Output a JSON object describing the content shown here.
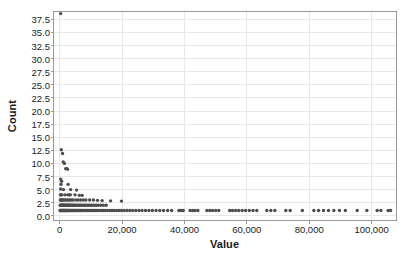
{
  "chart_data": {
    "type": "scatter",
    "title": "",
    "xlabel": "Value",
    "ylabel": "Count",
    "xlim": [
      -2000,
      108000
    ],
    "ylim": [
      -0.9,
      39.0
    ],
    "grid": true,
    "legend": false,
    "xticks": [
      0,
      20000,
      40000,
      60000,
      80000,
      100000
    ],
    "xticklabels": [
      "0",
      "20,000",
      "40,000",
      "60,000",
      "80,000",
      "100,000"
    ],
    "yticks": [
      0.0,
      2.5,
      5.0,
      7.5,
      10.0,
      12.5,
      15.0,
      17.5,
      20.0,
      22.5,
      25.0,
      27.5,
      30.0,
      32.5,
      35.0,
      37.5
    ],
    "yticklabels": [
      "0.0",
      "2.5",
      "5.0",
      "7.5",
      "10.0",
      "12.5",
      "15.0",
      "17.5",
      "20.0",
      "22.5",
      "25.0",
      "27.5",
      "30.0",
      "32.5",
      "35.0",
      "37.5"
    ],
    "marker_color": "#4d4d4d",
    "marker_size": 1.7,
    "grid_color": "#e8e8e8",
    "axis_color": "#9a9a9a",
    "points": [
      [
        300,
        38.6
      ],
      [
        500,
        12.6
      ],
      [
        900,
        11.9
      ],
      [
        1100,
        10.3
      ],
      [
        1500,
        10.0
      ],
      [
        1900,
        9.0
      ],
      [
        2300,
        9.0
      ],
      [
        2500,
        8.9
      ],
      [
        300,
        7.0
      ],
      [
        600,
        6.6
      ],
      [
        400,
        6.0
      ],
      [
        2700,
        6.0
      ],
      [
        300,
        5.1
      ],
      [
        1200,
        5.0
      ],
      [
        3500,
        5.0
      ],
      [
        5400,
        4.9
      ],
      [
        200,
        4.0
      ],
      [
        400,
        4.0
      ],
      [
        700,
        4.0
      ],
      [
        1700,
        4.0
      ],
      [
        2600,
        4.0
      ],
      [
        3100,
        4.0
      ],
      [
        3400,
        4.0
      ],
      [
        4900,
        4.0
      ],
      [
        6300,
        3.9
      ],
      [
        7200,
        3.9
      ],
      [
        200,
        3.0
      ],
      [
        350,
        3.0
      ],
      [
        500,
        3.0
      ],
      [
        800,
        3.0
      ],
      [
        1100,
        3.0
      ],
      [
        1400,
        3.0
      ],
      [
        1900,
        3.0
      ],
      [
        2400,
        3.0
      ],
      [
        2900,
        3.0
      ],
      [
        3300,
        3.0
      ],
      [
        3800,
        3.0
      ],
      [
        4300,
        3.0
      ],
      [
        5200,
        3.0
      ],
      [
        5900,
        3.0
      ],
      [
        6700,
        3.0
      ],
      [
        7600,
        3.0
      ],
      [
        8400,
        3.0
      ],
      [
        9600,
        3.0
      ],
      [
        10800,
        3.0
      ],
      [
        12100,
        2.95
      ],
      [
        13600,
        2.9
      ],
      [
        16300,
        2.85
      ],
      [
        19800,
        2.8
      ],
      [
        150,
        2.0
      ],
      [
        300,
        2.0
      ],
      [
        450,
        2.0
      ],
      [
        600,
        2.0
      ],
      [
        750,
        2.0
      ],
      [
        900,
        2.0
      ],
      [
        1050,
        2.0
      ],
      [
        1200,
        2.0
      ],
      [
        1350,
        2.0
      ],
      [
        1500,
        2.0
      ],
      [
        1700,
        2.0
      ],
      [
        1900,
        2.0
      ],
      [
        2100,
        2.0
      ],
      [
        2300,
        2.0
      ],
      [
        2500,
        2.0
      ],
      [
        2700,
        2.0
      ],
      [
        2900,
        2.0
      ],
      [
        3100,
        2.0
      ],
      [
        3300,
        2.0
      ],
      [
        3600,
        2.0
      ],
      [
        3900,
        2.0
      ],
      [
        4200,
        2.0
      ],
      [
        4500,
        2.0
      ],
      [
        4800,
        2.0
      ],
      [
        5100,
        2.0
      ],
      [
        5500,
        2.0
      ],
      [
        5900,
        2.0
      ],
      [
        6300,
        2.0
      ],
      [
        6700,
        2.0
      ],
      [
        7100,
        2.0
      ],
      [
        7600,
        2.0
      ],
      [
        8100,
        2.0
      ],
      [
        8600,
        2.0
      ],
      [
        9100,
        2.0
      ],
      [
        9700,
        2.0
      ],
      [
        10300,
        2.0
      ],
      [
        11000,
        2.0
      ],
      [
        11700,
        2.0
      ],
      [
        12400,
        2.0
      ],
      [
        13200,
        2.0
      ],
      [
        14000,
        2.0
      ],
      [
        14900,
        2.0
      ],
      [
        100,
        1.0
      ],
      [
        250,
        1.0
      ],
      [
        400,
        1.0
      ],
      [
        550,
        1.0
      ],
      [
        700,
        1.0
      ],
      [
        850,
        1.0
      ],
      [
        1000,
        1.0
      ],
      [
        1150,
        1.0
      ],
      [
        1300,
        1.0
      ],
      [
        1450,
        1.0
      ],
      [
        1600,
        1.0
      ],
      [
        1750,
        1.0
      ],
      [
        1900,
        1.0
      ],
      [
        2050,
        1.0
      ],
      [
        2200,
        1.0
      ],
      [
        2400,
        1.0
      ],
      [
        2600,
        1.0
      ],
      [
        2800,
        1.0
      ],
      [
        3000,
        1.0
      ],
      [
        3200,
        1.0
      ],
      [
        3400,
        1.0
      ],
      [
        3600,
        1.0
      ],
      [
        3800,
        1.0
      ],
      [
        4000,
        1.0
      ],
      [
        4250,
        1.0
      ],
      [
        4500,
        1.0
      ],
      [
        4750,
        1.0
      ],
      [
        5000,
        1.0
      ],
      [
        5250,
        1.0
      ],
      [
        5500,
        1.0
      ],
      [
        5800,
        1.0
      ],
      [
        6100,
        1.0
      ],
      [
        6400,
        1.0
      ],
      [
        6700,
        1.0
      ],
      [
        7000,
        1.0
      ],
      [
        7300,
        1.0
      ],
      [
        7700,
        1.0
      ],
      [
        8100,
        1.0
      ],
      [
        8500,
        1.0
      ],
      [
        8900,
        1.0
      ],
      [
        9300,
        1.0
      ],
      [
        9700,
        1.0
      ],
      [
        10200,
        1.0
      ],
      [
        10700,
        1.0
      ],
      [
        11200,
        1.0
      ],
      [
        11700,
        1.0
      ],
      [
        12200,
        1.0
      ],
      [
        12800,
        1.0
      ],
      [
        13400,
        1.0
      ],
      [
        14000,
        1.0
      ],
      [
        14600,
        1.0
      ],
      [
        15300,
        1.0
      ],
      [
        16000,
        1.0
      ],
      [
        16700,
        1.0
      ],
      [
        17400,
        1.0
      ],
      [
        18200,
        1.0
      ],
      [
        19000,
        1.0
      ],
      [
        19800,
        1.0
      ],
      [
        20700,
        1.0
      ],
      [
        21600,
        1.0
      ],
      [
        22500,
        1.0
      ],
      [
        23400,
        1.0
      ],
      [
        24400,
        1.0
      ],
      [
        25400,
        1.0
      ],
      [
        26400,
        1.0
      ],
      [
        27500,
        1.0
      ],
      [
        28600,
        1.0
      ],
      [
        29700,
        1.0
      ],
      [
        30900,
        1.0
      ],
      [
        32100,
        1.0
      ],
      [
        33300,
        1.0
      ],
      [
        34600,
        1.0
      ],
      [
        35900,
        1.0
      ],
      [
        38200,
        1.0
      ],
      [
        38900,
        1.0
      ],
      [
        39600,
        1.0
      ],
      [
        41800,
        1.0
      ],
      [
        42600,
        1.0
      ],
      [
        43400,
        1.0
      ],
      [
        44300,
        1.0
      ],
      [
        47200,
        1.0
      ],
      [
        48100,
        1.0
      ],
      [
        49000,
        1.0
      ],
      [
        50000,
        1.0
      ],
      [
        51000,
        1.0
      ],
      [
        54500,
        1.0
      ],
      [
        55400,
        1.0
      ],
      [
        56400,
        1.0
      ],
      [
        57400,
        1.0
      ],
      [
        58500,
        1.0
      ],
      [
        59600,
        1.0
      ],
      [
        60800,
        1.0
      ],
      [
        62000,
        1.0
      ],
      [
        63200,
        1.0
      ],
      [
        66400,
        1.0
      ],
      [
        67700,
        1.0
      ],
      [
        69000,
        1.0
      ],
      [
        72500,
        1.0
      ],
      [
        73900,
        1.0
      ],
      [
        77800,
        1.0
      ],
      [
        81500,
        1.0
      ],
      [
        83000,
        1.0
      ],
      [
        84600,
        1.0
      ],
      [
        86200,
        1.0
      ],
      [
        87900,
        1.0
      ],
      [
        89700,
        1.0
      ],
      [
        91600,
        1.0
      ],
      [
        95400,
        1.0
      ],
      [
        98500,
        1.0
      ],
      [
        101800,
        1.0
      ],
      [
        103000,
        1.0
      ],
      [
        105300,
        1.0
      ],
      [
        106100,
        1.0
      ]
    ]
  }
}
